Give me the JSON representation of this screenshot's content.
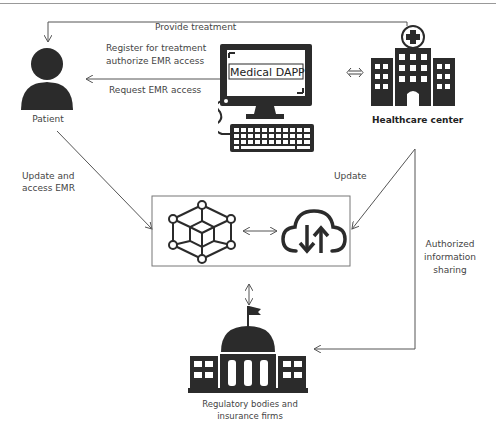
{
  "diagram": {
    "nodes": {
      "patient": {
        "label": "Patient",
        "icon": "person-icon"
      },
      "medical_dapp": {
        "label": "Medical DAPP",
        "icon": "desktop-computer-icon"
      },
      "healthcare_center": {
        "label": "Healthcare center",
        "icon": "hospital-icon"
      },
      "blockchain": {
        "icon": "blockchain-network-icon"
      },
      "cloud": {
        "icon": "cloud-sync-icon"
      },
      "regulatory": {
        "label_line1": "Regulatory bodies and",
        "label_line2": "insurance firms",
        "icon": "government-building-icon"
      }
    },
    "edges": {
      "provide_treatment": "Provide treatment",
      "register_line1": "Register for treatment",
      "register_line2": "authorize EMR access",
      "request_emr": "Request EMR access",
      "update_access_line1": "Update and",
      "update_access_line2": "access EMR",
      "update": "Update",
      "authorized_line1": "Authorized",
      "authorized_line2": "information",
      "authorized_line3": "sharing"
    },
    "colors": {
      "icon": "#2b2b2b",
      "line": "#666666",
      "text": "#444444"
    }
  }
}
